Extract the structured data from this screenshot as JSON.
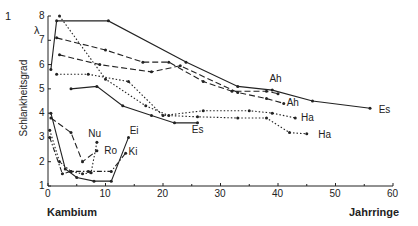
{
  "figure_number": "1",
  "chart_data": {
    "type": "line",
    "title": "",
    "xlabel_left": "Kambium",
    "xlabel_right": "Jahrringe",
    "ylabel": "Schlankheitsgrad",
    "ysymbol": "λ",
    "xlim": [
      0,
      60
    ],
    "ylim": [
      1,
      8
    ],
    "xticks": [
      0,
      10,
      20,
      30,
      40,
      50,
      60
    ],
    "yticks": [
      1,
      2,
      3,
      4,
      5,
      6,
      7,
      8
    ],
    "grid": false,
    "series": [
      {
        "name": "Es",
        "style": "solid",
        "x": [
          0.5,
          1.5,
          10.5,
          24,
          33,
          39,
          46,
          56
        ],
        "y": [
          5.8,
          7.8,
          7.8,
          6.1,
          5.1,
          4.95,
          4.5,
          4.2
        ]
      },
      {
        "name": "Es",
        "style": "solid",
        "x": [
          4,
          8.5,
          13,
          18,
          22,
          26
        ],
        "y": [
          5.0,
          5.1,
          4.3,
          3.9,
          3.6,
          3.6
        ]
      },
      {
        "name": "Ah",
        "style": "dashed",
        "x": [
          1.5,
          10,
          16.5,
          21,
          27,
          32,
          38,
          40
        ],
        "y": [
          7.1,
          6.6,
          6.1,
          6.1,
          5.3,
          4.9,
          4.9,
          4.8
        ]
      },
      {
        "name": "Ah",
        "style": "dashed",
        "x": [
          2,
          9,
          18,
          23,
          33,
          38,
          41
        ],
        "y": [
          6.4,
          6.0,
          5.7,
          5.95,
          4.85,
          4.6,
          4.4
        ]
      },
      {
        "name": "Ha",
        "style": "dotted",
        "x": [
          1.5,
          7,
          14,
          20,
          27,
          35,
          39,
          43
        ],
        "y": [
          5.6,
          5.6,
          5.3,
          3.9,
          4.1,
          4.1,
          4.0,
          3.8
        ]
      },
      {
        "name": "Ha",
        "style": "dotted",
        "x": [
          2,
          10,
          17,
          21,
          26,
          33,
          38,
          42,
          45
        ],
        "y": [
          8.0,
          5.4,
          4.3,
          3.9,
          3.85,
          3.8,
          3.8,
          3.2,
          3.15
        ]
      },
      {
        "name": "Nu",
        "style": "dashed",
        "x": [
          0.5,
          4,
          6,
          8.5
        ],
        "y": [
          3.8,
          3.2,
          2.0,
          2.45
        ]
      },
      {
        "name": "Ro",
        "style": "dotted",
        "x": [
          0.3,
          2,
          4,
          6,
          7.5,
          8.5
        ],
        "y": [
          3.3,
          2.0,
          1.6,
          1.5,
          1.55,
          2.8
        ]
      },
      {
        "name": "Ei",
        "style": "solid",
        "x": [
          0.5,
          3,
          5,
          8,
          11,
          14
        ],
        "y": [
          4.0,
          1.7,
          1.35,
          1.2,
          1.2,
          3.0
        ]
      },
      {
        "name": "Ki",
        "style": "dashdot",
        "x": [
          0.3,
          2.5,
          4,
          7,
          11,
          13.5
        ],
        "y": [
          3.0,
          1.5,
          1.6,
          1.6,
          1.6,
          2.35
        ]
      }
    ],
    "annotations": [
      {
        "text": "Ah",
        "x": 38.5,
        "y": 5.4
      },
      {
        "text": "Ah",
        "x": 41.5,
        "y": 4.4
      },
      {
        "text": "Es",
        "x": 57.5,
        "y": 4.15
      },
      {
        "text": "Ha",
        "x": 44,
        "y": 3.8
      },
      {
        "text": "Ha",
        "x": 47,
        "y": 3.1
      },
      {
        "text": "Es",
        "x": 25,
        "y": 3.3
      },
      {
        "text": "Nu",
        "x": 7,
        "y": 3.15
      },
      {
        "text": "Ro",
        "x": 9.8,
        "y": 2.45
      },
      {
        "text": "Ei",
        "x": 14.2,
        "y": 3.25
      },
      {
        "text": "Ki",
        "x": 14,
        "y": 2.4
      }
    ]
  }
}
